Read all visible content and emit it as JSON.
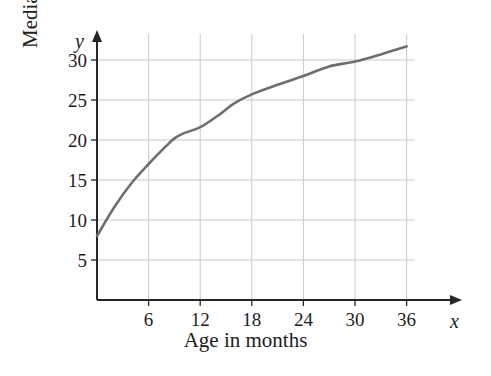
{
  "chart_data": {
    "type": "line",
    "title": "",
    "subtitle": "",
    "xlabel": "Age in months",
    "ylabel": "Median weight in pounds",
    "x_axis_variable": "x",
    "y_axis_variable": "y",
    "xlim": [
      0,
      36
    ],
    "ylim": [
      0,
      33
    ],
    "xticks": [
      6,
      12,
      18,
      24,
      30,
      36
    ],
    "xtick_labels": [
      "6",
      "12",
      "18",
      "24",
      "30",
      "36"
    ],
    "yticks": [
      5,
      10,
      15,
      20,
      25,
      30
    ],
    "ytick_labels": [
      "5",
      "10",
      "15",
      "20",
      "25",
      "30"
    ],
    "grid": true,
    "grid_color": "#c9c9c9",
    "axis_color": "#262626",
    "legend": null,
    "legend_position": "none",
    "series": [
      {
        "name": "Median weight",
        "color": "#6e6e6e",
        "line_width": 2.6,
        "x": [
          0,
          2,
          4,
          6,
          8,
          9,
          10,
          12,
          14,
          16,
          18,
          21,
          24,
          27,
          30,
          33,
          36
        ],
        "values": [
          8.0,
          11.6,
          14.6,
          17.0,
          19.2,
          20.2,
          20.8,
          21.6,
          23.0,
          24.6,
          25.7,
          26.9,
          28.0,
          29.2,
          29.8,
          30.7,
          31.7
        ]
      }
    ],
    "annotations": []
  },
  "geometry": {
    "plot_origin_x_px": 97,
    "plot_origin_y_px": 300,
    "x_px_per_month": 8.6,
    "y_px_per_pound": 8.0,
    "x_axis_arrow_end_px": 462,
    "y_axis_arrow_end_px": 30
  }
}
